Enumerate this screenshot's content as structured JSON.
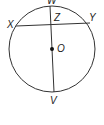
{
  "diagram": {
    "type": "circle-geometry",
    "labels": {
      "W": "W",
      "X": "X",
      "Y": "Y",
      "Z": "Z",
      "O": "O",
      "V": "V"
    },
    "segments": [
      {
        "name": "chord",
        "from": "X",
        "to": "Y"
      },
      {
        "name": "diameter",
        "from": "W",
        "to": "V",
        "through": [
          "Z",
          "O"
        ]
      }
    ],
    "center": "O",
    "line_color": "#333333"
  }
}
